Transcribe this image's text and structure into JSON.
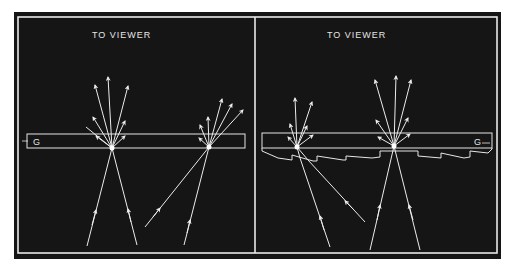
{
  "figure": {
    "background": "#ffffff",
    "plate_color": "#151515",
    "line_color": "#ececec",
    "panels": [
      {
        "id": "left",
        "title": "TO VIEWER",
        "glass_label": "G",
        "has_sawtooth_layer": false
      },
      {
        "id": "right",
        "title": "TO VIEWER",
        "glass_label": "G",
        "has_sawtooth_layer": true
      }
    ]
  }
}
